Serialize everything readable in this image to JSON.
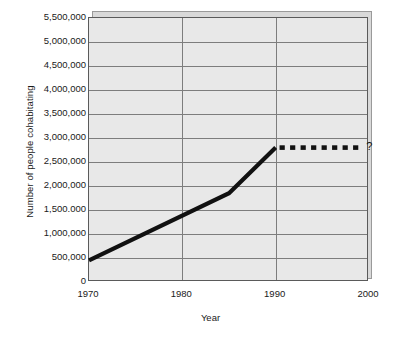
{
  "chart_data": {
    "type": "line",
    "title": "",
    "xlabel": "Year",
    "ylabel": "Number of people cohabitating",
    "xlim": [
      1970,
      2000
    ],
    "ylim": [
      0,
      5500000
    ],
    "grid": true,
    "legend": false,
    "x_ticklabels": [
      "1970",
      "1980",
      "1990",
      "2000"
    ],
    "x_tickvalues": [
      1970,
      1980,
      1990,
      2000
    ],
    "y_ticklabels": [
      "5,500,000",
      "5,000,000",
      "4,500,000",
      "4,000,000",
      "3,500,000",
      "3,000,000",
      "2,500,000",
      "2,000,000",
      "1,500.000",
      "1,000,000",
      "500,000",
      "0"
    ],
    "y_tickvalues": [
      5500000,
      5000000,
      4500000,
      4000000,
      3500000,
      3000000,
      2500000,
      2000000,
      1500000,
      1000000,
      500000,
      0
    ],
    "series": [
      {
        "name": "observed",
        "style": "solid",
        "color": "#111111",
        "x": [
          1970,
          1985,
          1990
        ],
        "values": [
          450000,
          1850000,
          2800000
        ]
      },
      {
        "name": "projected",
        "style": "dashed",
        "color": "#111111",
        "x": [
          1990,
          1999
        ],
        "values": [
          2800000,
          2800000
        ],
        "dash_count": 8
      }
    ],
    "annotations": [
      {
        "text": "?",
        "x": 1999.5,
        "y": 2800000
      }
    ]
  },
  "figure": {
    "plot_bg": "#e8e8e8",
    "page_bg": "#ffffff",
    "grid_color": "#7d7d7d",
    "frame_color": "#5a5a5a",
    "line_color": "#111111"
  }
}
